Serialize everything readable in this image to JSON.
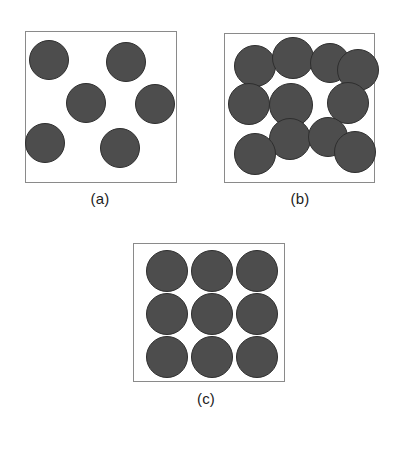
{
  "figure": {
    "title": "",
    "background_color": "#ffffff",
    "width": 395,
    "height": 453,
    "particle_fill": "#4d4d4d",
    "particle_stroke": "#2e2e2e",
    "box_stroke": "#8a8a8a",
    "caption_color": "#1c1c1c"
  },
  "panels": [
    {
      "id": "panel-a",
      "caption": "(a)",
      "caption_x": 100,
      "caption_y": 190,
      "box": {
        "x": 25,
        "y": 31,
        "w": 152,
        "h": 152
      },
      "particle_count": 6,
      "arrangement": "dilute-random",
      "particles": [
        {
          "cx": 49,
          "cy": 60,
          "r": 20
        },
        {
          "cx": 126,
          "cy": 62,
          "r": 20
        },
        {
          "cx": 86,
          "cy": 103,
          "r": 20
        },
        {
          "cx": 155,
          "cy": 104,
          "r": 20
        },
        {
          "cx": 45,
          "cy": 143,
          "r": 20
        },
        {
          "cx": 120,
          "cy": 148,
          "r": 20
        }
      ]
    },
    {
      "id": "panel-b",
      "caption": "(b)",
      "caption_x": 300,
      "caption_y": 190,
      "box": {
        "x": 224,
        "y": 33,
        "w": 151,
        "h": 150
      },
      "particle_count": 11,
      "arrangement": "dense-random",
      "particles": [
        {
          "cx": 255,
          "cy": 66,
          "r": 21
        },
        {
          "cx": 293,
          "cy": 58,
          "r": 21
        },
        {
          "cx": 330,
          "cy": 63,
          "r": 20
        },
        {
          "cx": 358,
          "cy": 70,
          "r": 21
        },
        {
          "cx": 249,
          "cy": 104,
          "r": 21
        },
        {
          "cx": 291,
          "cy": 105,
          "r": 22
        },
        {
          "cx": 348,
          "cy": 103,
          "r": 21
        },
        {
          "cx": 290,
          "cy": 139,
          "r": 21
        },
        {
          "cx": 328,
          "cy": 137,
          "r": 20
        },
        {
          "cx": 255,
          "cy": 154,
          "r": 21
        },
        {
          "cx": 355,
          "cy": 152,
          "r": 21
        }
      ]
    },
    {
      "id": "panel-c",
      "caption": "(c)",
      "caption_x": 206,
      "caption_y": 390,
      "box": {
        "x": 133,
        "y": 243,
        "w": 152,
        "h": 139
      },
      "particle_count": 9,
      "arrangement": "ordered-3x3-grid",
      "particles": [
        {
          "cx": 167,
          "cy": 271,
          "r": 21
        },
        {
          "cx": 212,
          "cy": 271,
          "r": 21
        },
        {
          "cx": 257,
          "cy": 271,
          "r": 21
        },
        {
          "cx": 167,
          "cy": 314,
          "r": 21
        },
        {
          "cx": 212,
          "cy": 314,
          "r": 21
        },
        {
          "cx": 257,
          "cy": 314,
          "r": 21
        },
        {
          "cx": 167,
          "cy": 357,
          "r": 21
        },
        {
          "cx": 212,
          "cy": 357,
          "r": 21
        },
        {
          "cx": 257,
          "cy": 357,
          "r": 21
        }
      ]
    }
  ]
}
